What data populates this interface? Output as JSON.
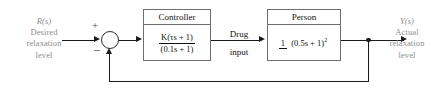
{
  "diagram": {
    "type": "control-system-block-diagram",
    "input": {
      "symbol": "R(s)",
      "line1": "Desired",
      "line2": "relaxation",
      "line3": "level"
    },
    "output": {
      "symbol": "Y(s)",
      "line1": "Actual",
      "line2": "relaxation",
      "line3": "level"
    },
    "summing_junction": {
      "plus": "+",
      "minus": "−"
    },
    "blocks": [
      {
        "title": "Controller",
        "numerator": "K(τs + 1)",
        "denominator": "(0.1s + 1)"
      },
      {
        "title": "Person",
        "numerator": "1",
        "denominator": "(0.5s + 1)",
        "denominator_exponent": "2"
      }
    ],
    "intermediate_signal": {
      "line1": "Drug",
      "line2": "input"
    },
    "feedback": "unity",
    "colors": {
      "wire": "#1a1a1a",
      "block_border": "#6e6e6e",
      "label_text": "#8d8d8d",
      "block_text": "#111111",
      "background": "#ffffff"
    }
  }
}
